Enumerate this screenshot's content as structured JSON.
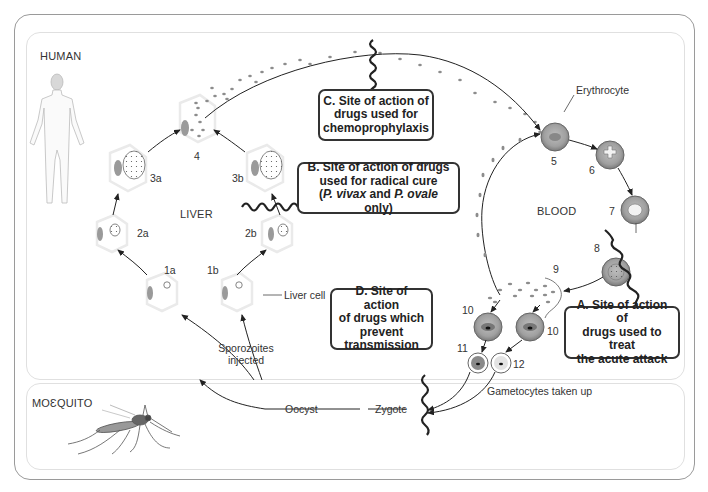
{
  "regions": {
    "human": "HUMAN",
    "mosquito": "MOƐQUITO",
    "liver": "LIVER",
    "blood": "BLOOD"
  },
  "stage_labels": {
    "s1a": "1a",
    "s1b": "1b",
    "s2a": "2a",
    "s2b": "2b",
    "s3a": "3a",
    "s3b": "3b",
    "s4": "4",
    "s5": "5",
    "s6": "6",
    "s7": "7",
    "s8": "8",
    "s9": "9",
    "s10a": "10",
    "s10b": "10",
    "s11": "11",
    "s12": "12"
  },
  "annotations": {
    "erythrocyte": "Erythrocyte",
    "liver_cell": "Liver cell",
    "sporozoites_line1": "Sporozoites",
    "sporozoites_line2": "injected",
    "gametocytes": "Gametocytes taken up",
    "oocyst": "Oocyst",
    "zygote": "Zygote"
  },
  "callouts": {
    "A": {
      "line1": "A.  Site of action of",
      "line2": "drugs used to treat",
      "line3": "the acute attack"
    },
    "B": {
      "line1": "B.  Site of action of drugs",
      "line2": "used for radical cure",
      "line3_pre": "(",
      "line3_i1": "P. vivax",
      "line3_mid": " and ",
      "line3_i2": "P. ovale",
      "line3_post": " only)"
    },
    "C": {
      "line1": "C.  Site of action of",
      "line2": "drugs used for",
      "line3": "chemoprophylaxis"
    },
    "D": {
      "line1": "D.  Site of action",
      "line2": "of drugs which",
      "line3": "prevent",
      "line4": "transmission"
    }
  },
  "colors": {
    "frame": "#9a9a9a",
    "panel_border": "#e0e0e0",
    "parasite": "#8c8c8c",
    "erythrocyte_fill": "#a8a8a8",
    "erythrocyte_ring": "#6e6e6e",
    "callout_border": "#333333"
  }
}
